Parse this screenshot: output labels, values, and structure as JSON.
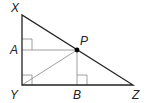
{
  "diagram": {
    "type": "geometry",
    "points": {
      "X": {
        "label": "X",
        "x": 22,
        "y": 15
      },
      "Y": {
        "label": "Y",
        "x": 22,
        "y": 85
      },
      "Z": {
        "label": "Z",
        "x": 133,
        "y": 85
      },
      "P": {
        "label": "P",
        "x": 77,
        "y": 50
      },
      "A": {
        "label": "A",
        "x": 22,
        "y": 50
      },
      "B": {
        "label": "B",
        "x": 77,
        "y": 85
      }
    },
    "right_angles": [
      "Y",
      "A",
      "B"
    ],
    "colors": {
      "main_line": "#222222",
      "thin_line": "#888888",
      "point": "#000000"
    }
  }
}
